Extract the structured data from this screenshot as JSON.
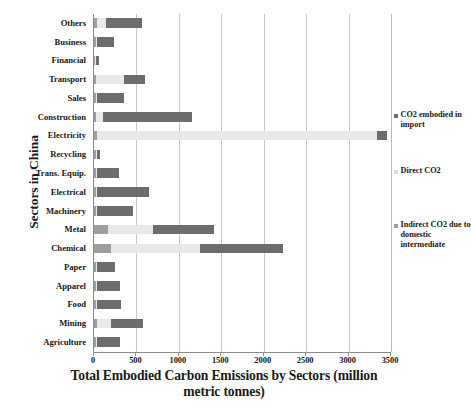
{
  "chart_data": {
    "type": "bar",
    "orientation": "horizontal",
    "stacked": true,
    "title": "",
    "xlabel": "Total Embodied Carbon Emissions by Sectors (million metric tonnes)",
    "ylabel": "Sectors in China",
    "xlim": [
      0,
      3500
    ],
    "xticks": [
      0,
      500,
      1000,
      1500,
      2000,
      2500,
      3000,
      3500
    ],
    "xtick_labels": [
      "0",
      "500",
      "1000",
      "1500",
      "2000",
      "2500",
      "3000",
      "3500"
    ],
    "grid": true,
    "grid_axis": "x",
    "legend_position": "right",
    "categories": [
      "Others",
      "Business",
      "Financial",
      "Transport",
      "Sales",
      "Construction",
      "Electricity",
      "Recycling",
      "Trans. Equip.",
      "Electrical",
      "Machinery",
      "Metal",
      "Chemical",
      "Paper",
      "Apparel",
      "Food",
      "Mining",
      "Agriculture"
    ],
    "series": [
      {
        "name": "Indirect CO2 due to domestic intermediate",
        "color": "#9e9e9e",
        "values": [
          30,
          20,
          15,
          25,
          20,
          25,
          35,
          20,
          20,
          25,
          20,
          165,
          200,
          20,
          20,
          20,
          30,
          20
        ]
      },
      {
        "name": "Direct CO2",
        "color": "#e9e9e9",
        "values": [
          110,
          15,
          10,
          325,
          15,
          85,
          3295,
          15,
          15,
          15,
          15,
          535,
          1050,
          15,
          15,
          15,
          170,
          15
        ]
      },
      {
        "name": "CO2 embodied in import",
        "color": "#6d6d6d",
        "values": [
          430,
          205,
          35,
          255,
          315,
          1050,
          120,
          35,
          265,
          610,
          425,
          720,
          980,
          215,
          275,
          285,
          380,
          275
        ]
      }
    ],
    "totals": [
      570,
      240,
      60,
      605,
      350,
      1160,
      3450,
      70,
      300,
      650,
      460,
      1420,
      2230,
      250,
      310,
      320,
      580,
      310
    ]
  },
  "legend": {
    "items": [
      {
        "label": "CO2 embodied in import",
        "swatch": "import"
      },
      {
        "label": "Direct CO2",
        "swatch": "direct"
      },
      {
        "label": "Indirect CO2 due to domestic intermediate",
        "swatch": "indirect"
      }
    ]
  },
  "axes": {
    "y_title": "Sectors in China",
    "x_title_line1": "Total Embodied Carbon Emissions by Sectors (million",
    "x_title_line2": "metric tonnes)"
  }
}
